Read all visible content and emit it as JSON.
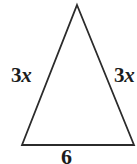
{
  "figure": {
    "type": "isosceles-triangle-diagram",
    "background_color": "#ffffff",
    "stroke_color": "#2b2b2b",
    "stroke_width": 1.8,
    "text_color": "#1c1c1c",
    "vertices": {
      "apex": {
        "x": 77,
        "y": 5
      },
      "bottom_left": {
        "x": 22,
        "y": 145
      },
      "bottom_right": {
        "x": 134,
        "y": 145
      }
    },
    "labels": {
      "left_leg": {
        "coefficient": "3",
        "variable": "x"
      },
      "right_leg": {
        "coefficient": "3",
        "variable": "x"
      },
      "base": "6"
    }
  }
}
